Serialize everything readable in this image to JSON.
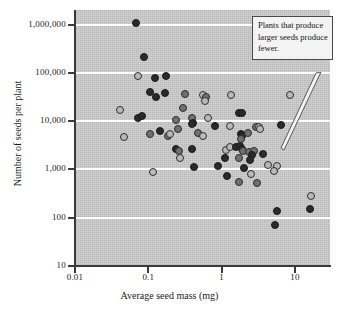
{
  "figure": {
    "background_color": "#ffffff",
    "plot_background_color": "#c9c9c9",
    "gridline_color": "#ffffff",
    "axis_color": "#3b3b3b"
  },
  "annotation": {
    "text": "Plants that produce larger seeds produce fewer.",
    "box_fill": "#f3f3f3",
    "box_border": "#4a4a4a"
  },
  "chart_data": {
    "type": "scatter",
    "title": "",
    "xlabel": "Average seed mass (mg)",
    "ylabel": "Number of seeds per plant",
    "xscale": "log",
    "yscale": "log",
    "xlim": [
      0.01,
      30
    ],
    "ylim": [
      10,
      2000000
    ],
    "grid": true,
    "legend": "none",
    "xticks": [
      0.01,
      0.1,
      1,
      10
    ],
    "xtick_labels": [
      "0.01",
      "0.1",
      "1",
      "10"
    ],
    "yticks": [
      10,
      100,
      1000,
      10000,
      100000,
      1000000
    ],
    "ytick_labels": [
      "10",
      "100",
      "1,000",
      "10,000",
      "100,000",
      "1,000,000"
    ],
    "marker_styles": {
      "dark": "#2a2a2a",
      "mid": "#707070",
      "light": "#b9b9b9"
    },
    "annotations": [
      {
        "text": "Plants that produce larger seeds produce fewer.",
        "points_to_x": 4.2,
        "points_to_y": 2600
      }
    ],
    "points": [
      {
        "x": 0.068,
        "y": 1100000,
        "style": "dark"
      },
      {
        "x": 0.088,
        "y": 210000,
        "style": "dark"
      },
      {
        "x": 0.073,
        "y": 88000,
        "style": "light"
      },
      {
        "x": 0.125,
        "y": 80000,
        "style": "dark"
      },
      {
        "x": 0.175,
        "y": 87000,
        "style": "dark"
      },
      {
        "x": 0.105,
        "y": 41000,
        "style": "dark"
      },
      {
        "x": 0.128,
        "y": 32000,
        "style": "dark"
      },
      {
        "x": 0.168,
        "y": 38000,
        "style": "dark"
      },
      {
        "x": 0.32,
        "y": 36000,
        "style": "mid"
      },
      {
        "x": 0.56,
        "y": 35000,
        "style": "light"
      },
      {
        "x": 0.62,
        "y": 31000,
        "style": "mid"
      },
      {
        "x": 0.6,
        "y": 26000,
        "style": "light"
      },
      {
        "x": 1.35,
        "y": 34000,
        "style": "light"
      },
      {
        "x": 8.5,
        "y": 35000,
        "style": "light"
      },
      {
        "x": 0.041,
        "y": 17000,
        "style": "light"
      },
      {
        "x": 0.072,
        "y": 11500,
        "style": "dark"
      },
      {
        "x": 0.082,
        "y": 12500,
        "style": "dark"
      },
      {
        "x": 0.3,
        "y": 18500,
        "style": "mid"
      },
      {
        "x": 0.235,
        "y": 10500,
        "style": "mid"
      },
      {
        "x": 0.4,
        "y": 11500,
        "style": "mid"
      },
      {
        "x": 0.41,
        "y": 9300,
        "style": "dark"
      },
      {
        "x": 0.66,
        "y": 11500,
        "style": "light"
      },
      {
        "x": 1.75,
        "y": 14500,
        "style": "dark"
      },
      {
        "x": 1.92,
        "y": 15000,
        "style": "dark"
      },
      {
        "x": 0.047,
        "y": 4800,
        "style": "light"
      },
      {
        "x": 0.105,
        "y": 5400,
        "style": "mid"
      },
      {
        "x": 0.145,
        "y": 6200,
        "style": "dark"
      },
      {
        "x": 0.185,
        "y": 4900,
        "style": "mid"
      },
      {
        "x": 0.195,
        "y": 5300,
        "style": "light"
      },
      {
        "x": 0.255,
        "y": 7000,
        "style": "mid"
      },
      {
        "x": 0.4,
        "y": 8800,
        "style": "dark"
      },
      {
        "x": 0.47,
        "y": 5700,
        "style": "mid"
      },
      {
        "x": 0.55,
        "y": 4900,
        "style": "light"
      },
      {
        "x": 0.82,
        "y": 7800,
        "style": "dark"
      },
      {
        "x": 1.3,
        "y": 7900,
        "style": "light"
      },
      {
        "x": 1.85,
        "y": 5400,
        "style": "dark"
      },
      {
        "x": 1.88,
        "y": 5000,
        "style": "dark"
      },
      {
        "x": 2.25,
        "y": 5600,
        "style": "mid"
      },
      {
        "x": 2.95,
        "y": 7400,
        "style": "mid"
      },
      {
        "x": 3.25,
        "y": 7500,
        "style": "light"
      },
      {
        "x": 3.35,
        "y": 6900,
        "style": "light"
      },
      {
        "x": 6.4,
        "y": 8200,
        "style": "dark"
      },
      {
        "x": 0.24,
        "y": 2700,
        "style": "dark"
      },
      {
        "x": 0.265,
        "y": 2350,
        "style": "mid"
      },
      {
        "x": 0.27,
        "y": 1750,
        "style": "light"
      },
      {
        "x": 0.4,
        "y": 2700,
        "style": "dark"
      },
      {
        "x": 1.15,
        "y": 2500,
        "style": "light"
      },
      {
        "x": 1.3,
        "y": 2900,
        "style": "light"
      },
      {
        "x": 1.55,
        "y": 2850,
        "style": "dark"
      },
      {
        "x": 1.8,
        "y": 3000,
        "style": "dark"
      },
      {
        "x": 1.82,
        "y": 4200,
        "style": "mid"
      },
      {
        "x": 1.9,
        "y": 2700,
        "style": "dark"
      },
      {
        "x": 1.95,
        "y": 2450,
        "style": "mid"
      },
      {
        "x": 2.35,
        "y": 2250,
        "style": "mid"
      },
      {
        "x": 2.75,
        "y": 2400,
        "style": "mid"
      },
      {
        "x": 2.6,
        "y": 2000,
        "style": "dark"
      },
      {
        "x": 3.65,
        "y": 2050,
        "style": "dark"
      },
      {
        "x": 0.115,
        "y": 890,
        "style": "light"
      },
      {
        "x": 0.42,
        "y": 1100,
        "style": "dark"
      },
      {
        "x": 0.88,
        "y": 1150,
        "style": "dark"
      },
      {
        "x": 1.1,
        "y": 1700,
        "style": "dark"
      },
      {
        "x": 1.72,
        "y": 1700,
        "style": "mid"
      },
      {
        "x": 2.0,
        "y": 1050,
        "style": "dark"
      },
      {
        "x": 2.45,
        "y": 1600,
        "style": "dark"
      },
      {
        "x": 4.3,
        "y": 1250,
        "style": "light"
      },
      {
        "x": 5.6,
        "y": 1150,
        "style": "light"
      },
      {
        "x": 5.2,
        "y": 940,
        "style": "light"
      },
      {
        "x": 1.2,
        "y": 740,
        "style": "dark"
      },
      {
        "x": 1.72,
        "y": 560,
        "style": "mid"
      },
      {
        "x": 2.55,
        "y": 790,
        "style": "light"
      },
      {
        "x": 3.05,
        "y": 520,
        "style": "mid"
      },
      {
        "x": 16.5,
        "y": 280,
        "style": "light"
      },
      {
        "x": 5.6,
        "y": 140,
        "style": "dark"
      },
      {
        "x": 16.0,
        "y": 150,
        "style": "dark"
      },
      {
        "x": 5.4,
        "y": 70,
        "style": "dark"
      }
    ]
  }
}
